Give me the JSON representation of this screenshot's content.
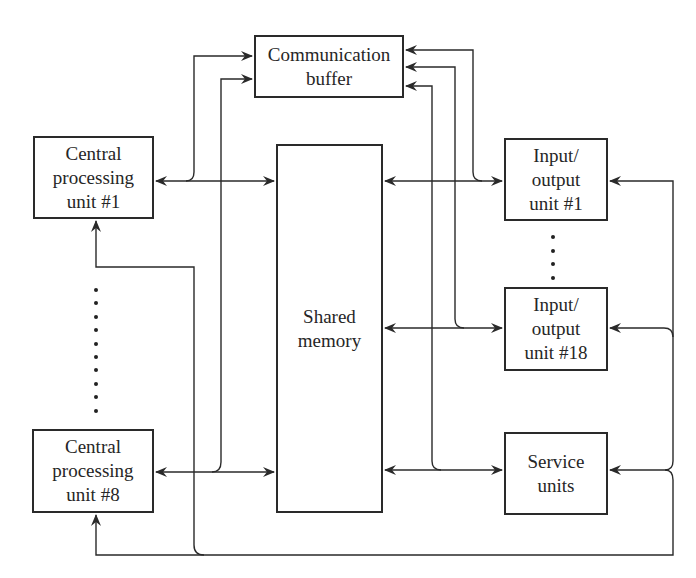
{
  "diagram": {
    "title": "",
    "nodes": {
      "communication_buffer": {
        "label": "Communication\nbuffer"
      },
      "cpu_1": {
        "label": "Central\nprocessing\nunit #1"
      },
      "cpu_8": {
        "label": "Central\nprocessing\nunit #8"
      },
      "shared_memory": {
        "label": "Shared\nmemory"
      },
      "io_1": {
        "label": "Input/\noutput\nunit #1"
      },
      "io_18": {
        "label": "Input/\noutput\nunit #18"
      },
      "service_units": {
        "label": "Service\nunits"
      }
    },
    "ellipses": {
      "cpu_range": {
        "count": 10,
        "between": [
          "cpu_1",
          "cpu_8"
        ]
      },
      "io_range": {
        "count": 4,
        "between": [
          "io_1",
          "io_18"
        ]
      }
    },
    "edges": [
      {
        "from": "cpu_1",
        "to": "shared_memory",
        "type": "bidirectional"
      },
      {
        "from": "cpu_8",
        "to": "shared_memory",
        "type": "bidirectional"
      },
      {
        "from": "shared_memory",
        "to": "io_1",
        "type": "bidirectional"
      },
      {
        "from": "shared_memory",
        "to": "io_18",
        "type": "bidirectional"
      },
      {
        "from": "shared_memory",
        "to": "service_units",
        "type": "bidirectional"
      },
      {
        "from": "cpu_1",
        "to": "communication_buffer",
        "type": "directed"
      },
      {
        "from": "cpu_8",
        "to": "communication_buffer",
        "type": "directed"
      },
      {
        "from": "io_1",
        "to": "communication_buffer",
        "type": "directed"
      },
      {
        "from": "io_18",
        "to": "communication_buffer",
        "type": "directed"
      },
      {
        "from": "service_units",
        "to": "communication_buffer",
        "type": "directed"
      },
      {
        "from": "service_units",
        "to": "io_1",
        "type": "directed"
      },
      {
        "from": "service_units",
        "to": "io_18",
        "type": "directed"
      },
      {
        "from": "service_units",
        "to": "service_units",
        "type": "directed"
      },
      {
        "from": "service_units",
        "to": "cpu_1",
        "type": "directed"
      },
      {
        "from": "service_units",
        "to": "cpu_8",
        "type": "directed"
      }
    ],
    "colors": {
      "line": "#2a2a2a",
      "background": "#ffffff"
    }
  }
}
